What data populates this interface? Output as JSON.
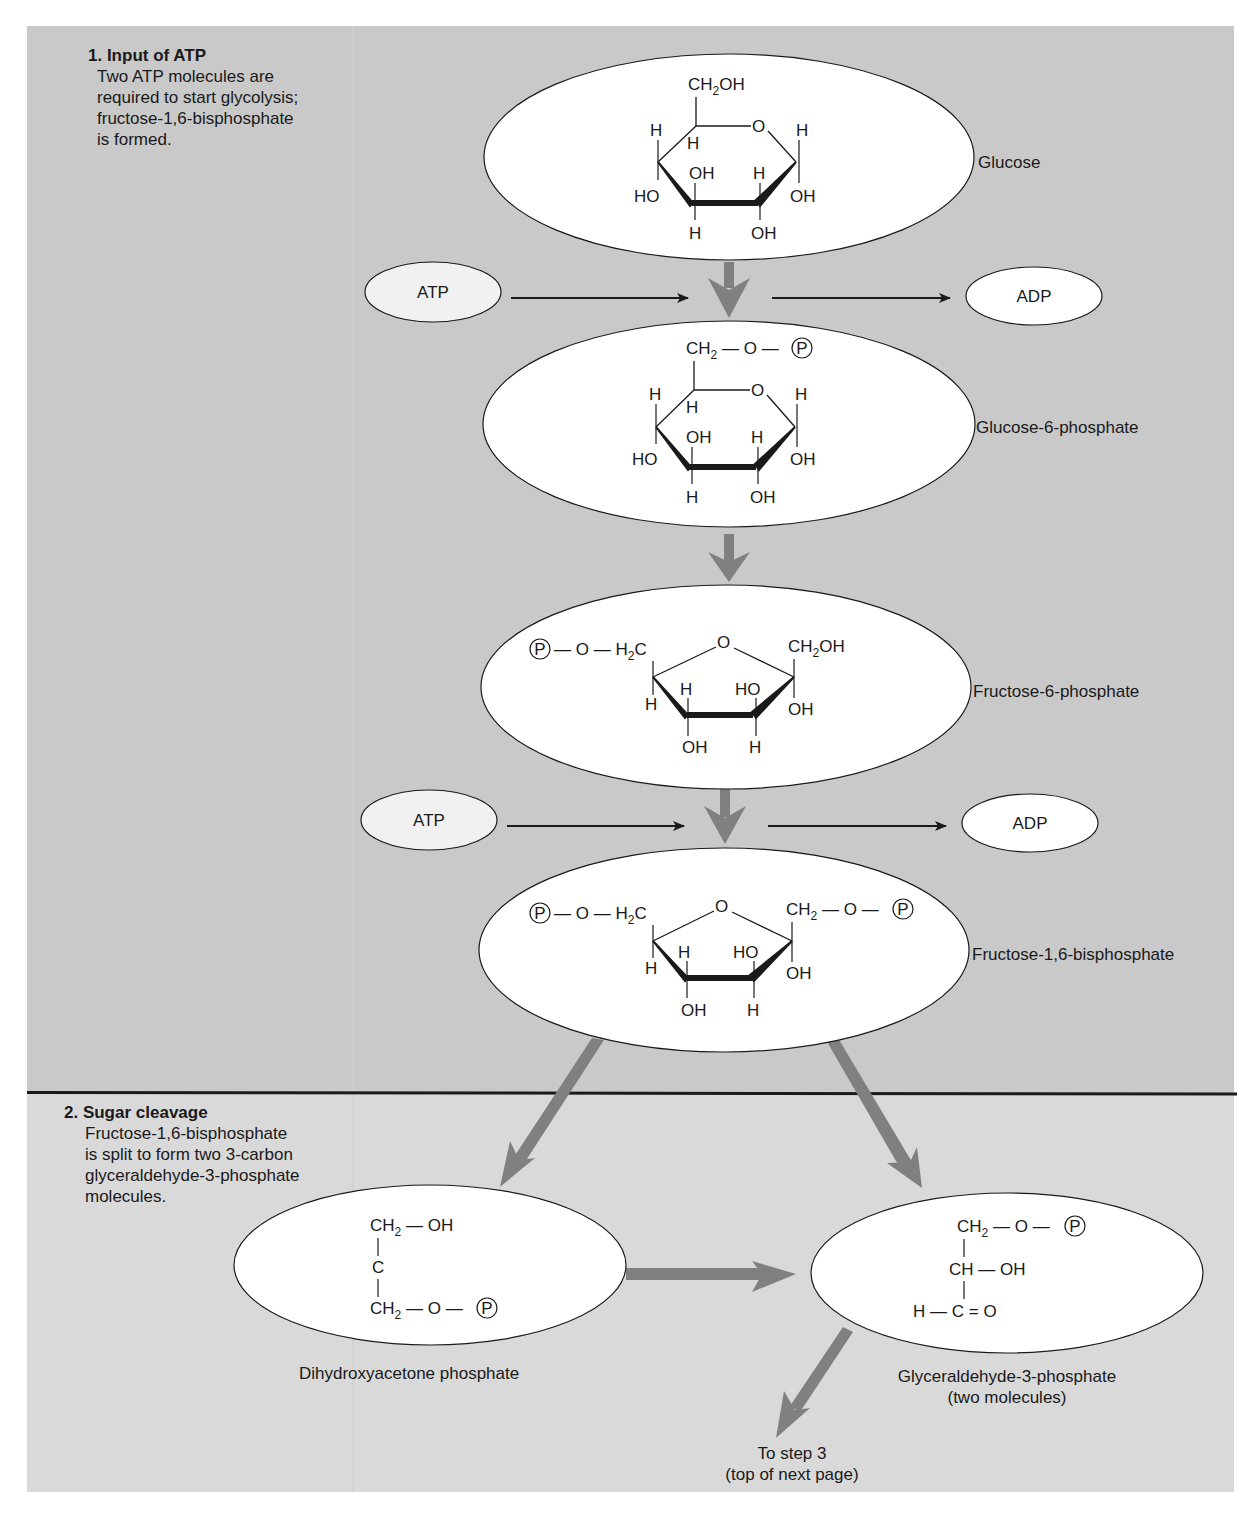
{
  "steps": [
    {
      "title": "1. Input of ATP",
      "body_lines": [
        "Two ATP molecules are",
        "required to start glycolysis;",
        "fructose-1,6-bisphosphate",
        "is formed."
      ]
    },
    {
      "title": "2. Sugar cleavage",
      "body_lines": [
        "Fructose-1,6-bisphosphate",
        "is split to form two 3-carbon",
        "glyceraldehyde-3-phosphate",
        "molecules."
      ]
    }
  ],
  "molecules": {
    "glucose": {
      "label": "Glucose",
      "top_group": "CH2OH"
    },
    "glucose_6_phosphate": {
      "label": "Glucose-6-phosphate",
      "top_group": "CH2—O—P"
    },
    "fructose_6_phosphate": {
      "label": "Fructose-6-phosphate",
      "left_group": "P—O—H2C",
      "right_group": "CH2OH"
    },
    "fructose_1_6_bisphosphate": {
      "label": "Fructose-1,6-bisphosphate",
      "left_group": "P—O—H2C",
      "right_group": "CH2—O—P"
    },
    "dihydroxyacetone_phosphate": {
      "label": "Dihydroxyacetone phosphate",
      "lines": [
        "CH2—OH",
        "C",
        "CH2—O—P"
      ]
    },
    "glyceraldehyde_3_phosphate": {
      "label_line1": "Glyceraldehyde-3-phosphate",
      "label_line2": "(two molecules)",
      "lines": [
        "CH2—O—P",
        "CH—OH",
        "H—C=O"
      ]
    }
  },
  "cofactors": [
    {
      "input": "ATP",
      "output": "ADP"
    },
    {
      "input": "ATP",
      "output": "ADP"
    }
  ],
  "atoms": {
    "H": "H",
    "O": "O",
    "OH": "OH",
    "HO": "HO",
    "C": "C",
    "P": "P",
    "CH2": "CH",
    "sub2": "2"
  },
  "footer": {
    "line1": "To step 3",
    "line2": "(top of next page)"
  },
  "colors": {
    "panel": "#c9c9c9",
    "panel_lower": "#d9d9d9",
    "arrow": "#808080",
    "ellipse": "#ffffff",
    "text": "#1a1a1a"
  }
}
